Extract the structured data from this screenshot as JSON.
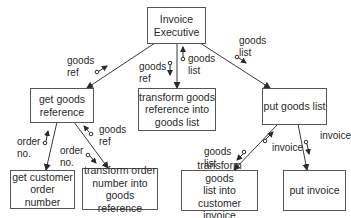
{
  "modules": {
    "invoice_executive": "Invoice\nExecutive",
    "get_goods_reference": "get goods\nreference",
    "transform_goods_reference": "transform goods\nreference into\ngoods list",
    "put_goods_list": "put goods list",
    "get_customer_order_number": "get customer\norder number",
    "transform_order_number": "transform order\nnumber into\ngoods reference",
    "transform_goods_list": "transform goods\nlist into customer\ninvoice",
    "put_invoice": "put invoice"
  },
  "couples": {
    "exec_to_ggr_up": "goods\nref",
    "exec_to_tgr_down": "goods\nref",
    "exec_to_tgr_up": "goods\nlist",
    "exec_to_pgl_down": "goods\nlist",
    "ggr_to_gcon_up": "order\nno.",
    "ggr_to_ton_down": "order\nno.",
    "ggr_to_ton_up": "goods\nref",
    "pgl_to_tgl_down": "goods\nlist",
    "pgl_to_tgl_up": "invoice",
    "pgl_to_pi_down": "invoice"
  },
  "colors": {
    "line": "#3a3a3a",
    "box_border": "#555555",
    "text": "#2a2a2a"
  }
}
